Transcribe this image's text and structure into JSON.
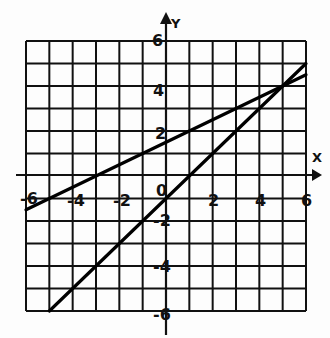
{
  "chart_data": {
    "type": "line",
    "title": "",
    "xlabel": "X",
    "ylabel": "Y",
    "xlim": [
      -6,
      6
    ],
    "ylim": [
      -6,
      6
    ],
    "grid": true,
    "grid_step": 1,
    "x_tick_labels": [
      "-6",
      "-4",
      "-2",
      "0",
      "2",
      "4",
      "6"
    ],
    "y_tick_labels": [
      "6",
      "4",
      "2",
      "-2",
      "-4",
      "-6"
    ],
    "series": [
      {
        "name": "line-1",
        "equation": "y = 0.5x + 1.5",
        "x": [
          -6,
          6
        ],
        "y": [
          -1.5,
          4.5
        ]
      },
      {
        "name": "line-2",
        "equation": "y = x - 1",
        "x": [
          -5,
          6
        ],
        "y": [
          -6,
          5
        ]
      }
    ],
    "intersection": {
      "x": 5,
      "y": 4
    }
  },
  "labels": {
    "x_axis": "X",
    "y_axis": "Y",
    "x_ticks": {
      "n6": "-6",
      "n4": "-4",
      "n2": "-2",
      "zero": "0",
      "p2": "2",
      "p4": "4",
      "p6": "6"
    },
    "y_ticks": {
      "p6": "6",
      "p4": "4",
      "p2": "2",
      "n2": "-2",
      "n4": "-4",
      "n6": "-6"
    }
  }
}
